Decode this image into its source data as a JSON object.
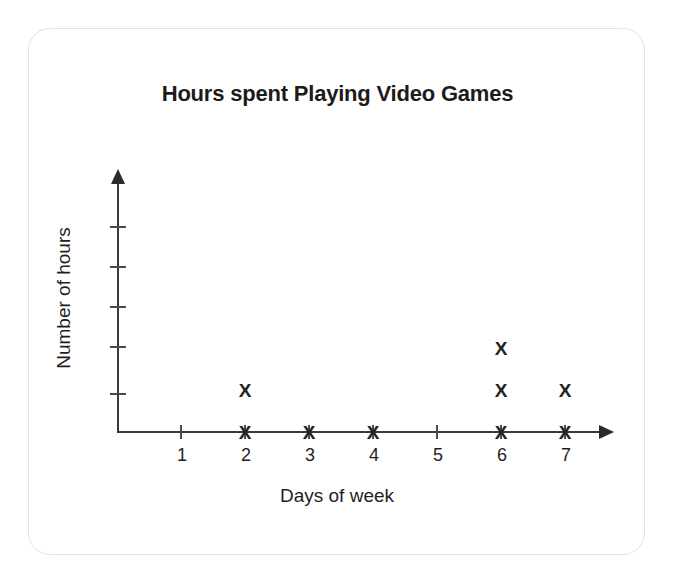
{
  "chart_data": {
    "type": "scatter",
    "plot_style": "dot-plot",
    "title": "Hours spent Playing Video Games",
    "xlabel": "Days of week",
    "ylabel": "Number of hours",
    "marker": "X",
    "grid": false,
    "legend": null,
    "categories": [
      "1",
      "2",
      "3",
      "4",
      "5",
      "6",
      "7"
    ],
    "x": [
      1,
      2,
      3,
      4,
      5,
      6,
      7
    ],
    "values": [
      0,
      2,
      1,
      1,
      0,
      3,
      2
    ],
    "xlim": [
      0,
      7
    ],
    "ylim": [
      0,
      5
    ],
    "x_tick_labels": [
      "1",
      "2",
      "3",
      "4",
      "5",
      "6",
      "7"
    ],
    "y_tick_labels": [
      "",
      "",
      "",
      "",
      ""
    ],
    "y_tick_count": 5,
    "points": [
      {
        "x": 2,
        "stack": 1
      },
      {
        "x": 2,
        "stack": 2
      },
      {
        "x": 3,
        "stack": 1
      },
      {
        "x": 4,
        "stack": 1
      },
      {
        "x": 6,
        "stack": 1
      },
      {
        "x": 6,
        "stack": 2
      },
      {
        "x": 6,
        "stack": 3
      },
      {
        "x": 7,
        "stack": 1
      },
      {
        "x": 7,
        "stack": 2
      }
    ],
    "colors": {
      "marker": "#222222",
      "axis": "#3a3a3a",
      "text": "#1f1f1f",
      "title": "#1b1b1b",
      "card_border": "#e2e2e2",
      "background": "#ffffff"
    }
  },
  "layout": {
    "x_tick_start_px": 88,
    "x_tick_step_px": 64,
    "row_base_px": 394,
    "row_step_px": 42,
    "y_tick_positions_px": [
      197,
      237,
      277,
      317,
      364
    ]
  }
}
